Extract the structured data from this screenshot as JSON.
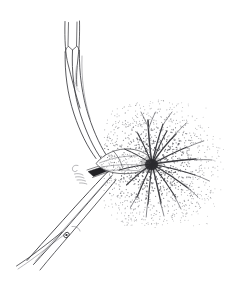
{
  "figure": {
    "subject": "grass culm node with expanding inflorescence and subtending leaf blade",
    "style": "pen-and-ink line drawing with stipple shading",
    "background_color": "#ffffff",
    "ink_color": "#3a3a3e",
    "stipple_color": "#4a4a50",
    "dark_accent_color": "#222226",
    "canvas": {
      "width": 227,
      "height": 297
    },
    "parts": [
      {
        "id": "upper-sheath",
        "label": "upper leaf sheath",
        "description": "narrow tapering tubular sheath at top of figure with inner ligule line",
        "interactable": false
      },
      {
        "id": "culm-stem",
        "label": "culm",
        "description": "three parallel curved outline strokes forming the arching stem",
        "interactable": false
      },
      {
        "id": "node-collar",
        "label": "node collar",
        "description": "dark band marking the stem node at the junction",
        "interactable": false
      },
      {
        "id": "leaf-blade",
        "label": "subtending leaf blade",
        "description": "lanceolate pointed blade emerging at the node, lightly stippled",
        "interactable": false
      },
      {
        "id": "inflorescence",
        "label": "inflorescence",
        "description": "radiating umbel-like starburst of slender rays surrounded by dense stipple",
        "ray_count": 16,
        "interactable": false
      },
      {
        "id": "lower-culm",
        "label": "lower culm and second sheath",
        "description": "long tapering paired strokes descending to lower-left with a small oval node mark",
        "interactable": false
      },
      {
        "id": "node-mark",
        "label": "oval node mark",
        "description": "small dark ellipse on the lower culm",
        "interactable": false
      }
    ]
  },
  "chart_data": {
    "type": "scatter",
    "xlabel": "",
    "ylabel": "",
    "xlim": [
      0,
      227
    ],
    "ylim": [
      0,
      297
    ],
    "grid": false,
    "legend": "none",
    "annotations": [
      "upper leaf sheath",
      "arching culm",
      "node collar",
      "subtending leaf blade",
      "radiating inflorescence",
      "lower culm",
      "oval node mark"
    ]
  }
}
